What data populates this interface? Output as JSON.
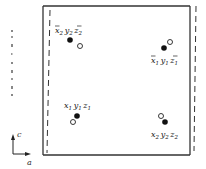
{
  "figure": {
    "frame": {
      "left": 43,
      "top": 6,
      "right": 190,
      "bottom": 155,
      "stroke": "#333333"
    },
    "dashed_frame": {
      "left_top_x": 50,
      "left_bottom_x": 47,
      "right_top_x": 196,
      "right_bottom_x": 194,
      "top": 6,
      "bottom": 155
    },
    "points": [
      {
        "id": "top-left",
        "label_parts": [
          [
            "x",
            "2",
            true
          ],
          [
            "y",
            "2",
            false
          ],
          [
            "z",
            "2",
            true
          ]
        ],
        "label_x": 55,
        "label_y": 33,
        "filled": [
          70,
          40
        ],
        "open": [
          80,
          46
        ]
      },
      {
        "id": "top-right",
        "label_parts": [
          [
            "x",
            "1",
            true
          ],
          [
            "y",
            "1",
            false
          ],
          [
            "z",
            "1",
            true
          ]
        ],
        "label_x": 151,
        "label_y": 63,
        "filled": [
          164,
          48
        ],
        "open": [
          170,
          42
        ]
      },
      {
        "id": "bottom-left",
        "label_parts": [
          [
            "x",
            "1",
            false
          ],
          [
            "y",
            "1",
            false
          ],
          [
            "z",
            "1",
            false
          ]
        ],
        "label_x": 64,
        "label_y": 108,
        "filled": [
          77,
          116
        ],
        "open": [
          73,
          122
        ]
      },
      {
        "id": "bottom-right",
        "label_parts": [
          [
            "x",
            "2",
            false
          ],
          [
            "y",
            "2",
            false
          ],
          [
            "z",
            "2",
            false
          ]
        ],
        "label_x": 151,
        "label_y": 137,
        "filled": [
          165,
          122
        ],
        "open": [
          161,
          116
        ]
      }
    ],
    "labels": {
      "top_left": "x̄2 y2 z̄2",
      "top_right": "x̄1 y1 z̄1",
      "bottom_left": "x1 y1 z1",
      "bottom_right": "x2 y2 z2"
    },
    "axes": {
      "vertical_label": "c",
      "horizontal_label": "a",
      "origin": [
        13,
        155
      ]
    },
    "left_margin_text": "cropped text fragments (illegible)"
  }
}
